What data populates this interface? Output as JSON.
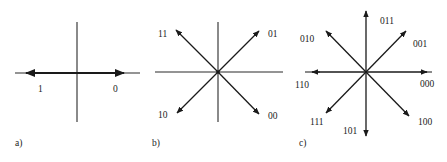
{
  "diagram": {
    "panels": [
      {
        "id": "a",
        "caption": "a)",
        "points": [
          {
            "label": "1",
            "angle_deg": 180
          },
          {
            "label": "0",
            "angle_deg": 0
          }
        ]
      },
      {
        "id": "b",
        "caption": "b)",
        "points": [
          {
            "label": "11",
            "angle_deg": 135
          },
          {
            "label": "01",
            "angle_deg": 45
          },
          {
            "label": "10",
            "angle_deg": 225
          },
          {
            "label": "00",
            "angle_deg": 315
          }
        ]
      },
      {
        "id": "c",
        "caption": "c)",
        "points": [
          {
            "label": "000",
            "angle_deg": 0
          },
          {
            "label": "001",
            "angle_deg": 45
          },
          {
            "label": "011",
            "angle_deg": 90
          },
          {
            "label": "010",
            "angle_deg": 135
          },
          {
            "label": "110",
            "angle_deg": 180
          },
          {
            "label": "111",
            "angle_deg": 225
          },
          {
            "label": "101",
            "angle_deg": 270
          },
          {
            "label": "100",
            "angle_deg": 315
          }
        ]
      }
    ]
  },
  "colors": {
    "line": "#1a1a1a",
    "background": "#ffffff"
  }
}
